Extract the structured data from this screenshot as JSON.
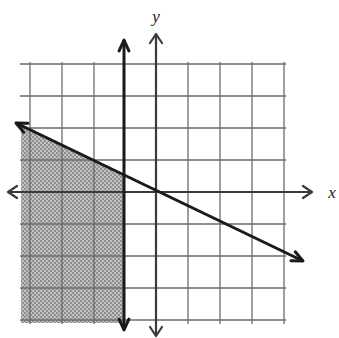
{
  "figure": {
    "kind": "coordinate-plane-inequality-graph",
    "background_color": "#ffffff",
    "width": 339,
    "height": 338
  },
  "axes": {
    "x_label": "x",
    "y_label": "y",
    "axis_color": "#3a3a3a",
    "origin_px": {
      "x": 156,
      "y": 192
    },
    "cell_size_px": 32,
    "x_axis": {
      "y_px": 192,
      "start_px": 8,
      "end_px": 312,
      "arrow_left": true,
      "arrow_right": true
    },
    "y_axis": {
      "x_px": 156,
      "start_px": 34,
      "end_px": 336,
      "arrow_up": true,
      "arrow_down": true
    }
  },
  "grid": {
    "visible": true,
    "color": "#6b6b6b",
    "vertical_lines_px": [
      30,
      62,
      94,
      124,
      156,
      188,
      220,
      252,
      284
    ],
    "horizontal_lines_px": [
      64,
      96,
      128,
      160,
      192,
      224,
      256,
      288,
      320
    ],
    "plot_rect_px": {
      "left": 20,
      "top": 62,
      "right": 286,
      "bottom": 324
    }
  },
  "chart_data": {
    "type": "line",
    "title": "",
    "xlabel": "x",
    "ylabel": "y",
    "xlim": [
      -4.5,
      4.5
    ],
    "ylim": [
      -4.5,
      4.5
    ],
    "grid": true,
    "legend": "none",
    "series": [
      {
        "name": "vertical-boundary",
        "style": "solid",
        "equation": "x = -1",
        "points_px": [
          {
            "x": 124,
            "y": 40
          },
          {
            "x": 124,
            "y": 330
          }
        ],
        "arrow_start": true,
        "arrow_end": true,
        "color": "#1a1a1a",
        "width_px": 3
      },
      {
        "name": "diagonal-boundary",
        "style": "solid",
        "equation": "y = -x/2",
        "slope": -0.5,
        "intercept": 0,
        "points_px": [
          {
            "x": 16,
            "y": 123
          },
          {
            "x": 303,
            "y": 261
          }
        ],
        "arrow_start": true,
        "arrow_end": true,
        "color": "#1a1a1a",
        "width_px": 3
      }
    ],
    "shaded_region": {
      "name": "solution-region",
      "description": "region left of x = -1 and below the line y = -x/2",
      "fill_color": "#a9a9a9",
      "fill_pattern": "halftone-dither",
      "polygon_px": [
        {
          "x": 21,
          "y": 124
        },
        {
          "x": 124,
          "y": 174
        },
        {
          "x": 124,
          "y": 323
        },
        {
          "x": 21,
          "y": 323
        }
      ]
    }
  }
}
